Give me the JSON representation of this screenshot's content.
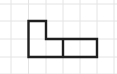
{
  "diagram": {
    "type": "grid-polyomino",
    "grid": {
      "columns_x": [
        11,
        28.5,
        46,
        63,
        80,
        97,
        114
      ],
      "rows_y": [
        4,
        21,
        39,
        57,
        74
      ],
      "line_color": "#e4e4e4"
    },
    "shape": {
      "description": "L-shaped figure made of a 1x2 vertical piece and a 1x2 horizontal rectangle divided in two cells",
      "outline_color": "#1f1f1f",
      "stroke_width": 2.4,
      "outline_points": "28.5,21 46,21 46,39 97,39 97,57 28.5,57",
      "divider": {
        "x": 63,
        "y1": 39,
        "y2": 57
      }
    }
  }
}
